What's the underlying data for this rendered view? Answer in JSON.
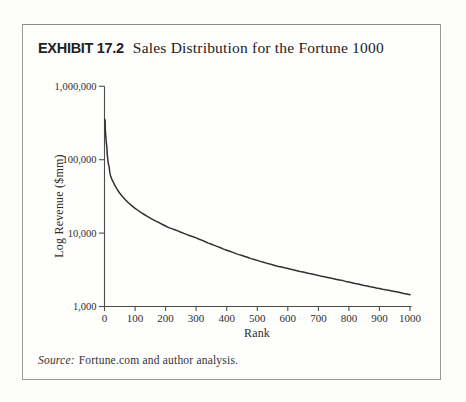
{
  "exhibit": {
    "label": "EXHIBIT 17.2",
    "title": "Sales Distribution for the Fortune 1000"
  },
  "source": {
    "prefix": "Source:",
    "text": "Fortune.com and author analysis."
  },
  "chart_data": {
    "type": "line",
    "title": "Sales Distribution for the Fortune 1000",
    "xlabel": "Rank",
    "ylabel": "Log Revenue ($mm)",
    "y_scale": "log",
    "grid": false,
    "legend": "none",
    "xlim": [
      0,
      1000
    ],
    "ylim": [
      1000,
      1000000
    ],
    "x_ticks": [
      0,
      100,
      200,
      300,
      400,
      500,
      600,
      700,
      800,
      900,
      1000
    ],
    "x_tick_labels": [
      "0",
      "100",
      "200",
      "300",
      "400",
      "500",
      "600",
      "700",
      "800",
      "900",
      "1000"
    ],
    "y_ticks": [
      1000,
      10000,
      100000,
      1000000
    ],
    "y_tick_labels": [
      "1,000",
      "10,000",
      "100,000",
      "1,000,000"
    ],
    "series": [
      {
        "name": "Fortune 1000 revenue by rank ($mm)",
        "points": [
          [
            1,
            355000
          ],
          [
            2,
            340000
          ],
          [
            3,
            248000
          ],
          [
            4,
            215000
          ],
          [
            5,
            193000
          ],
          [
            6,
            172000
          ],
          [
            7,
            158000
          ],
          [
            8,
            145000
          ],
          [
            9,
            120000
          ],
          [
            10,
            107000
          ],
          [
            11,
            98000
          ],
          [
            12,
            91000
          ],
          [
            13,
            86000
          ],
          [
            14,
            83500
          ],
          [
            15,
            81500
          ],
          [
            16,
            74000
          ],
          [
            17,
            69000
          ],
          [
            18,
            65000
          ],
          [
            20,
            60000
          ],
          [
            22,
            57000
          ],
          [
            25,
            53000
          ],
          [
            28,
            50000
          ],
          [
            30,
            48000
          ],
          [
            35,
            44000
          ],
          [
            40,
            40500
          ],
          [
            45,
            37500
          ],
          [
            50,
            35000
          ],
          [
            60,
            31000
          ],
          [
            70,
            28000
          ],
          [
            80,
            25500
          ],
          [
            90,
            23500
          ],
          [
            100,
            21700
          ],
          [
            110,
            20300
          ],
          [
            120,
            19000
          ],
          [
            130,
            17900
          ],
          [
            140,
            16900
          ],
          [
            150,
            16000
          ],
          [
            160,
            15200
          ],
          [
            170,
            14500
          ],
          [
            180,
            13800
          ],
          [
            190,
            13100
          ],
          [
            200,
            12500
          ],
          [
            210,
            11900
          ],
          [
            220,
            11500
          ],
          [
            230,
            11100
          ],
          [
            240,
            10700
          ],
          [
            250,
            10300
          ],
          [
            260,
            9900
          ],
          [
            270,
            9550
          ],
          [
            280,
            9200
          ],
          [
            290,
            8900
          ],
          [
            300,
            8600
          ],
          [
            310,
            8250
          ],
          [
            320,
            7950
          ],
          [
            330,
            7600
          ],
          [
            340,
            7300
          ],
          [
            350,
            7050
          ],
          [
            360,
            6800
          ],
          [
            370,
            6550
          ],
          [
            380,
            6300
          ],
          [
            390,
            6050
          ],
          [
            400,
            5850
          ],
          [
            410,
            5650
          ],
          [
            420,
            5450
          ],
          [
            430,
            5250
          ],
          [
            440,
            5100
          ],
          [
            450,
            4950
          ],
          [
            460,
            4800
          ],
          [
            470,
            4650
          ],
          [
            480,
            4500
          ],
          [
            490,
            4370
          ],
          [
            500,
            4250
          ],
          [
            510,
            4120
          ],
          [
            520,
            4000
          ],
          [
            530,
            3900
          ],
          [
            540,
            3800
          ],
          [
            550,
            3700
          ],
          [
            560,
            3600
          ],
          [
            570,
            3520
          ],
          [
            580,
            3450
          ],
          [
            590,
            3370
          ],
          [
            600,
            3300
          ],
          [
            610,
            3220
          ],
          [
            620,
            3150
          ],
          [
            630,
            3070
          ],
          [
            640,
            3000
          ],
          [
            650,
            2950
          ],
          [
            660,
            2880
          ],
          [
            670,
            2820
          ],
          [
            680,
            2760
          ],
          [
            690,
            2700
          ],
          [
            700,
            2650
          ],
          [
            710,
            2590
          ],
          [
            720,
            2540
          ],
          [
            730,
            2490
          ],
          [
            740,
            2440
          ],
          [
            750,
            2390
          ],
          [
            760,
            2340
          ],
          [
            770,
            2290
          ],
          [
            780,
            2250
          ],
          [
            790,
            2200
          ],
          [
            800,
            2150
          ],
          [
            810,
            2110
          ],
          [
            820,
            2060
          ],
          [
            830,
            2020
          ],
          [
            840,
            1980
          ],
          [
            850,
            1940
          ],
          [
            860,
            1900
          ],
          [
            870,
            1860
          ],
          [
            880,
            1830
          ],
          [
            890,
            1790
          ],
          [
            900,
            1760
          ],
          [
            910,
            1720
          ],
          [
            920,
            1690
          ],
          [
            930,
            1660
          ],
          [
            940,
            1630
          ],
          [
            950,
            1600
          ],
          [
            960,
            1570
          ],
          [
            970,
            1540
          ],
          [
            980,
            1510
          ],
          [
            990,
            1480
          ],
          [
            1000,
            1450
          ]
        ]
      }
    ]
  }
}
